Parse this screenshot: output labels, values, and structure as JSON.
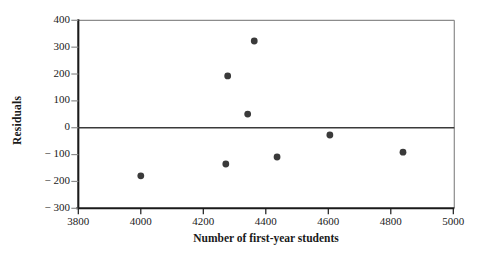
{
  "chart_data": {
    "type": "scatter",
    "title": "",
    "xlabel": "Number of first-year students",
    "ylabel": "Residuals",
    "xlim": [
      3800,
      5000
    ],
    "ylim": [
      -300,
      400
    ],
    "xticks": [
      3800,
      4000,
      4200,
      4400,
      4600,
      4800,
      5000
    ],
    "xtick_labels": [
      "3800",
      "4000",
      "4200",
      "4400",
      "4600",
      "4800",
      "5000"
    ],
    "yticks": [
      400,
      300,
      200,
      100,
      0,
      -100,
      -200,
      -300
    ],
    "ytick_labels": [
      "400",
      "300",
      "200",
      "100",
      "0",
      "− 100",
      "− 200",
      "− 300"
    ],
    "grid": false,
    "legend": null,
    "reference_line": {
      "y": 0,
      "color": "#3a3a3a"
    },
    "marker": {
      "shape": "circle",
      "color": "#3a3a3a",
      "size": 3.4
    },
    "x": [
      4000,
      4272,
      4278,
      4342,
      4363,
      4436,
      4605,
      4839
    ],
    "y": [
      -179,
      -135,
      193,
      51,
      323,
      -109,
      -27,
      -91
    ],
    "points": [
      {
        "x": 4000,
        "y": -179
      },
      {
        "x": 4272,
        "y": -135
      },
      {
        "x": 4278,
        "y": 193
      },
      {
        "x": 4342,
        "y": 51
      },
      {
        "x": 4363,
        "y": 323
      },
      {
        "x": 4436,
        "y": -109
      },
      {
        "x": 4605,
        "y": -27
      },
      {
        "x": 4839,
        "y": -91
      }
    ]
  },
  "colors": {
    "axis": "#1a1a1a",
    "frame_light": "#8c8c8c",
    "marker": "#3a3a3a",
    "zero_line": "#3a3a3a",
    "background": "#ffffff"
  }
}
